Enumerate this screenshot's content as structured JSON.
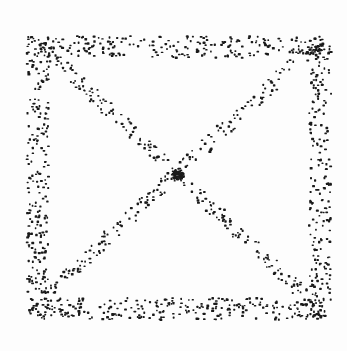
{
  "image": {
    "description": "Stippled dot drawing of a square frame with both diagonals, dense cluster at center",
    "background": "#fdfdfd",
    "dot_color": "#1a1a1a"
  },
  "chart_data": {
    "type": "scatter",
    "title": "",
    "xlabel": "",
    "ylabel": "",
    "grid": false,
    "xlim": [
      0,
      347
    ],
    "ylim": [
      0,
      351
    ],
    "structure": {
      "frame": {
        "left": 27,
        "right": 318,
        "top": 36,
        "bottom": 318,
        "band_width": 22
      },
      "diagonals": [
        {
          "from": [
            40,
            45
          ],
          "to": [
            310,
            300
          ],
          "band_width": 14
        },
        {
          "from": [
            320,
            40
          ],
          "to": [
            35,
            305
          ],
          "band_width": 14
        }
      ],
      "center_cluster": {
        "x": 178,
        "y": 174,
        "radius": 6
      }
    },
    "series": [
      {
        "name": "frame-top",
        "count": 230
      },
      {
        "name": "frame-bottom",
        "count": 260
      },
      {
        "name": "frame-left",
        "count": 230
      },
      {
        "name": "frame-right",
        "count": 220
      },
      {
        "name": "diagonal-tl-br",
        "count": 200
      },
      {
        "name": "diagonal-tr-bl",
        "count": 200
      },
      {
        "name": "center",
        "count": 60
      }
    ]
  }
}
